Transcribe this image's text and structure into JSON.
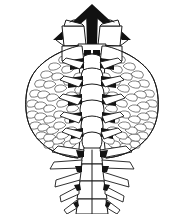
{
  "figure": {
    "title": "Lizard, dorsal view",
    "technique": "black-and-white stipple and line engraving",
    "orientation": "dorsal",
    "view_label": "",
    "background_color": "#ffffff",
    "ink_color": "#111111",
    "line_color": "#1a1a1a",
    "scale_line_color": "#3a3a3a",
    "width_px": 184,
    "height_px": 214
  },
  "anatomy": {
    "head": {
      "label": "head",
      "shape": "triangular chevron",
      "apex_fill": "#111111",
      "apex_x": 92,
      "apex_y": 6,
      "left_corner_x": 58,
      "right_corner_x": 128,
      "base_y": 40
    },
    "nuchal_shields": {
      "label": "nuchal shields",
      "count": 2
    },
    "vertebral_column": {
      "label": "vertebral column",
      "plate_count": 9,
      "plate_fill": "#ffffff"
    },
    "lateral_flanks": {
      "label": "lateral scaled flanks",
      "side_count": 2,
      "texture": "imbricate scales",
      "widest_y": 120,
      "left_extent_x": 25,
      "right_extent_x": 160
    },
    "tail": {
      "label": "spiny tail",
      "segment_count": 4,
      "spine_pairs": 5
    },
    "spines": {
      "label": "lateral spines",
      "shape": "elongate pointed"
    }
  }
}
